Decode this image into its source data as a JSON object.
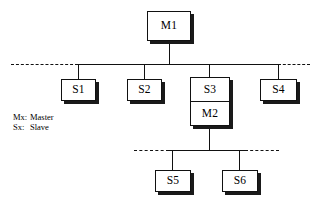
{
  "diagram": {
    "type": "hierarchy-bus-tree",
    "background_color": "#ffffff",
    "line_color": "#111111",
    "box_fill_color": "#ffffff",
    "shadow_color": "#1a1a1a"
  },
  "nodes": {
    "m1": {
      "label": "M1",
      "role": "master"
    },
    "s1": {
      "label": "S1",
      "role": "slave"
    },
    "s2": {
      "label": "S2",
      "role": "slave"
    },
    "s3": {
      "label": "S3",
      "role": "slave"
    },
    "m2": {
      "label": "M2",
      "role": "master"
    },
    "s4": {
      "label": "S4",
      "role": "slave"
    },
    "s5": {
      "label": "S5",
      "role": "slave"
    },
    "s6": {
      "label": "S6",
      "role": "slave"
    }
  },
  "legend": {
    "rows": [
      {
        "key": "Mx:",
        "value": "Master"
      },
      {
        "key": "Sx:",
        "value": "Slave"
      }
    ]
  },
  "buses": {
    "top_bus": {
      "name": "upper-bus",
      "dashed_ends": true,
      "attached_nodes": [
        "S1",
        "S2",
        "S3",
        "S4"
      ],
      "master": "M1"
    },
    "bottom_bus": {
      "name": "lower-bus",
      "dashed_ends": true,
      "attached_nodes": [
        "S5",
        "S6"
      ],
      "master": "M2"
    }
  }
}
